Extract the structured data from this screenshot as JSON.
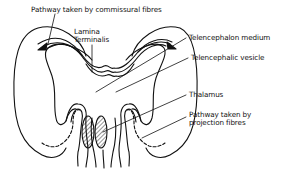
{
  "diagram": {
    "colors": {
      "stroke": "#111111",
      "background": "#ffffff",
      "text": "#111111"
    },
    "labels": {
      "commissural": "Pathway taken by commissural fibres",
      "lamina_line1": "Lamina",
      "lamina_line2": "Terminalis",
      "telencephalon_medium": "Telencephalon medium",
      "telencephalic_vesicle": "Telencephalic vesicle",
      "thalamus": "Thalamus",
      "projection_line1": "Pathway taken by",
      "projection_line2": "projection fibres"
    }
  }
}
